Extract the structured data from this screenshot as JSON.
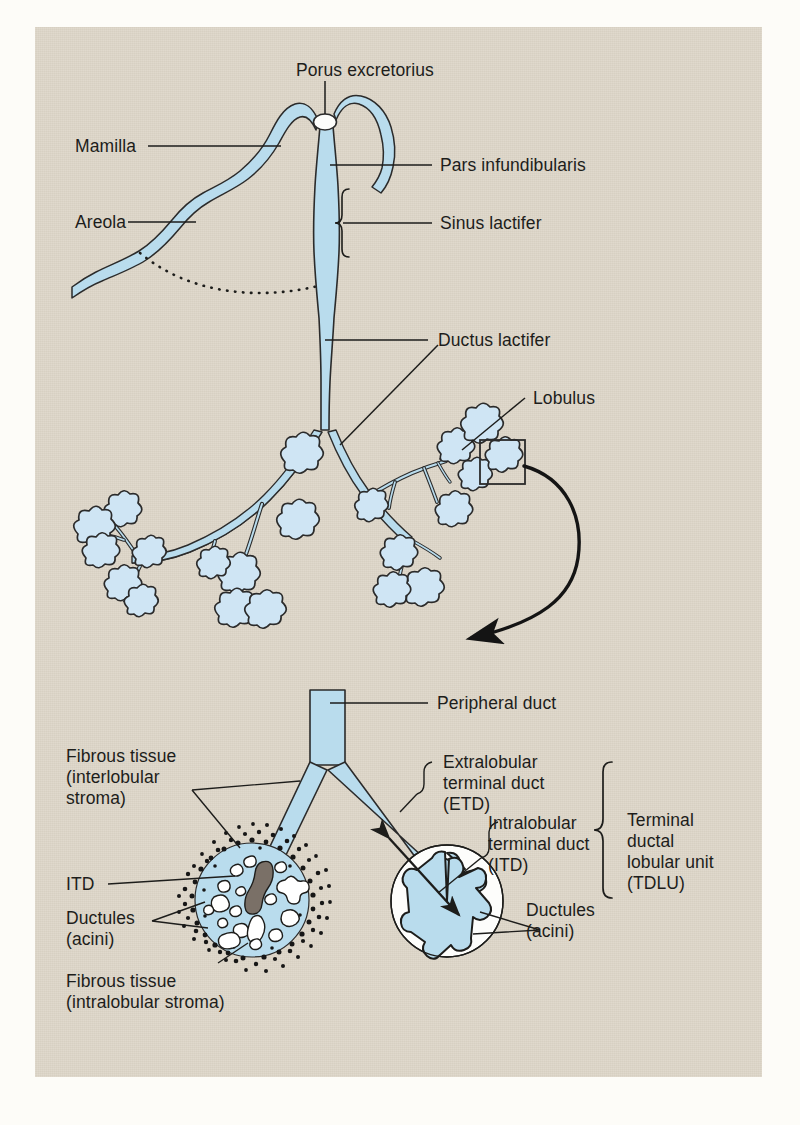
{
  "figure": {
    "background_color": "#ded7c9",
    "page_color": "#fdfcf8",
    "duct_fill_color": "#b9dced",
    "duct_stroke_color": "#2b2b2b",
    "label_color": "#1d1d1b",
    "stroma_dot_color": "#161616",
    "itd_fill_color": "#7a7067"
  },
  "upper_view": {
    "labels": {
      "porus_excretorius": "Porus excretorius",
      "mamilla": "Mamilla",
      "pars_infundibularis": "Pars infundibularis",
      "areola": "Areola",
      "sinus_lactifer": "Sinus lactifer",
      "ductus_lactifer": "Ductus lactifer",
      "lobulus": "Lobulus"
    }
  },
  "lower_view": {
    "labels": {
      "peripheral_duct": "Peripheral duct",
      "fibrous_tissue_interlobular_l1": "Fibrous tissue",
      "fibrous_tissue_interlobular_l2": "(interlobular",
      "fibrous_tissue_interlobular_l3": "stroma)",
      "itd_short": "ITD",
      "ductules_acini_left_l1": "Ductules",
      "ductules_acini_left_l2": "(acini)",
      "fibrous_tissue_intralobular_l1": "Fibrous tissue",
      "fibrous_tissue_intralobular_l2": "(intralobular stroma)",
      "etd_l1": "Extralobular",
      "etd_l2": "terminal duct",
      "etd_l3": "(ETD)",
      "itd_l1": "Intralobular",
      "itd_l2": "terminal duct",
      "itd_l3": "(ITD)",
      "ductules_acini_right_l1": "Ductules",
      "ductules_acini_right_l2": "(acini)",
      "tdlu_l1": "Terminal",
      "tdlu_l2": "ductal",
      "tdlu_l3": "lobular unit",
      "tdlu_l4": "(TDLU)"
    }
  }
}
